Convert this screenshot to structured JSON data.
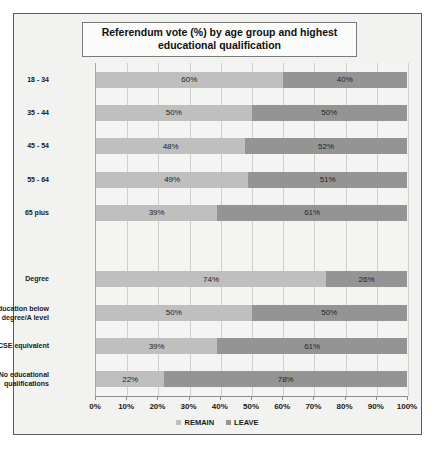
{
  "chart": {
    "title": "Referendum vote (%) by age group and highest educational qualification",
    "legend": [
      {
        "label": "REMAIN",
        "color": "#bfbfbf"
      },
      {
        "label": "LEAVE",
        "color": "#949494"
      }
    ]
  },
  "chart_data": {
    "type": "bar",
    "orientation": "horizontal",
    "stacked": true,
    "stacked_normalized": true,
    "title": "Referendum vote (%) by age group and highest educational qualification",
    "xlabel": "",
    "ylabel": "",
    "xlim": [
      0,
      100
    ],
    "xticks": [
      0,
      10,
      20,
      30,
      40,
      50,
      60,
      70,
      80,
      90,
      100
    ],
    "xtick_labels": [
      "0%",
      "10%",
      "20%",
      "30%",
      "40%",
      "50%",
      "60%",
      "70%",
      "80%",
      "90%",
      "100%"
    ],
    "grid": true,
    "legend_position": "bottom",
    "categories": [
      "18 - 34",
      "35 - 44",
      "45 - 54",
      "55 - 64",
      "65 plus",
      "",
      "Degree",
      "Higher education below degree/A level",
      "GCSE equivalent",
      "No educational qualifications"
    ],
    "series": [
      {
        "name": "REMAIN",
        "color": "#bfbfbf",
        "values": [
          60,
          50,
          48,
          49,
          39,
          null,
          74,
          50,
          39,
          22
        ]
      },
      {
        "name": "LEAVE",
        "color": "#949494",
        "values": [
          40,
          50,
          52,
          51,
          61,
          null,
          26,
          50,
          61,
          78
        ]
      }
    ],
    "bars": [
      {
        "category": "18 - 34",
        "remain": 60,
        "leave": 40,
        "remain_label": "60%",
        "leave_label": "40%"
      },
      {
        "category": "35 - 44",
        "remain": 50,
        "leave": 50,
        "remain_label": "50%",
        "leave_label": "50%"
      },
      {
        "category": "45 - 54",
        "remain": 48,
        "leave": 52,
        "remain_label": "48%",
        "leave_label": "52%"
      },
      {
        "category": "55 - 64",
        "remain": 49,
        "leave": 51,
        "remain_label": "49%",
        "leave_label": "51%"
      },
      {
        "category": "65 plus",
        "remain": 39,
        "leave": 61,
        "remain_label": "39%",
        "leave_label": "61%"
      },
      {
        "category": "",
        "remain": null,
        "leave": null,
        "remain_label": "",
        "leave_label": ""
      },
      {
        "category": "Degree",
        "remain": 74,
        "leave": 26,
        "remain_label": "74%",
        "leave_label": "26%"
      },
      {
        "category": "Higher education below degree/A level",
        "remain": 50,
        "leave": 50,
        "remain_label": "50%",
        "leave_label": "50%"
      },
      {
        "category": "GCSE equivalent",
        "remain": 39,
        "leave": 61,
        "remain_label": "39%",
        "leave_label": "61%"
      },
      {
        "category": "No educational qualifications",
        "remain": 22,
        "leave": 78,
        "remain_label": "22%",
        "leave_label": "78%"
      }
    ]
  }
}
